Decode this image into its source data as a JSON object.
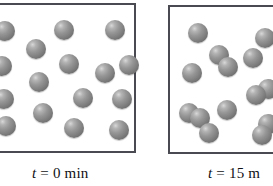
{
  "figure": {
    "name": "reaction-progress-particle-diagram",
    "background_color": "#ffffff",
    "width": 273,
    "height": 186
  },
  "style": {
    "particle_color": "#8a8a8a",
    "particle_highlight": "#d8d8d8",
    "particle_shadow": "#5c5c5e",
    "box_border_color": "#4a4a52",
    "text_color": "#111114"
  },
  "panels": [
    {
      "id": "initial",
      "caption": {
        "variable": "t",
        "equals": "=",
        "value": "0",
        "unit": "min",
        "full": "t = 0 min"
      },
      "particle_count": 16,
      "molecule_type": "single atoms",
      "particle_radius": 10,
      "particles": [
        {
          "cx": 5,
          "cy": 31
        },
        {
          "cx": 64,
          "cy": 30
        },
        {
          "cx": 115,
          "cy": 30
        },
        {
          "cx": 36,
          "cy": 49
        },
        {
          "cx": 2,
          "cy": 66
        },
        {
          "cx": 69,
          "cy": 64
        },
        {
          "cx": 105,
          "cy": 73
        },
        {
          "cx": 129,
          "cy": 65
        },
        {
          "cx": 39,
          "cy": 82
        },
        {
          "cx": 4,
          "cy": 99
        },
        {
          "cx": 83,
          "cy": 98
        },
        {
          "cx": 122,
          "cy": 99
        },
        {
          "cx": 43,
          "cy": 113
        },
        {
          "cx": 6,
          "cy": 126
        },
        {
          "cx": 74,
          "cy": 128
        },
        {
          "cx": 119,
          "cy": 130
        }
      ]
    },
    {
      "id": "final",
      "caption": {
        "variable": "t",
        "equals": "=",
        "value": "15",
        "unit": "m",
        "full": "t = 15 m"
      },
      "particle_count": 14,
      "molecule_type": "diatomic pairs and single atoms",
      "particle_radius": 10,
      "particles": [
        {
          "cx": 198,
          "cy": 33
        },
        {
          "cx": 265,
          "cy": 38
        },
        {
          "cx": 219,
          "cy": 55
        },
        {
          "cx": 228,
          "cy": 67
        },
        {
          "cx": 253,
          "cy": 58
        },
        {
          "cx": 192,
          "cy": 73
        },
        {
          "cx": 268,
          "cy": 89
        },
        {
          "cx": 256,
          "cy": 95
        },
        {
          "cx": 189,
          "cy": 113
        },
        {
          "cx": 200,
          "cy": 118
        },
        {
          "cx": 227,
          "cy": 110
        },
        {
          "cx": 209,
          "cy": 133
        },
        {
          "cx": 268,
          "cy": 124
        },
        {
          "cx": 262,
          "cy": 135
        }
      ]
    }
  ]
}
